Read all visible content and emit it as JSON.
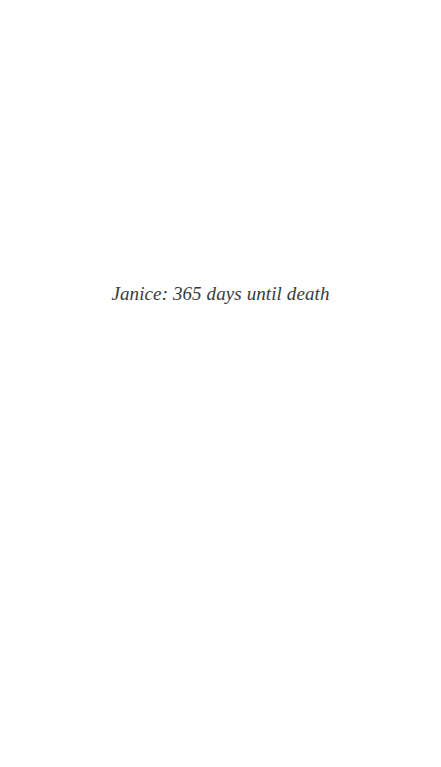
{
  "page": {
    "text": "Janice: 365 days until death"
  }
}
